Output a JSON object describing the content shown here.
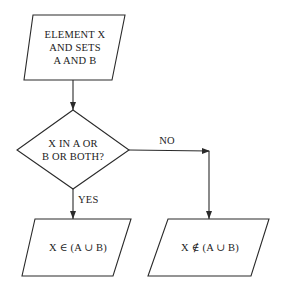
{
  "diagram": {
    "type": "flowchart",
    "nodes": [
      {
        "id": "start",
        "shape": "parallelogram",
        "lines": [
          "ELEMENT X",
          "AND SETS",
          "A AND B"
        ]
      },
      {
        "id": "decision",
        "shape": "diamond",
        "lines": [
          "X IN A OR",
          "B OR BOTH?"
        ]
      },
      {
        "id": "yes_result",
        "shape": "parallelogram",
        "text": "X ∈ (A ∪ B)"
      },
      {
        "id": "no_result",
        "shape": "parallelogram",
        "text": "X ∉ (A ∪ B)"
      }
    ],
    "edges": [
      {
        "from": "start",
        "to": "decision",
        "label": ""
      },
      {
        "from": "decision",
        "to": "yes_result",
        "label": "YES"
      },
      {
        "from": "decision",
        "to": "no_result",
        "label": "NO"
      }
    ],
    "stroke_color": "#2a2a2a"
  }
}
